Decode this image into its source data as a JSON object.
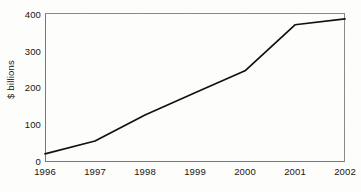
{
  "chart_data": {
    "type": "line",
    "title": "",
    "xlabel": "",
    "ylabel": "$ billions",
    "categories": [
      "1996",
      "1997",
      "1998",
      "1999",
      "2000",
      "2001",
      "2002"
    ],
    "x": [
      1996,
      1997,
      1998,
      1999,
      2000,
      2001,
      2002
    ],
    "values": [
      22,
      57,
      128,
      188,
      248,
      373,
      389
    ],
    "series": [
      {
        "name": "",
        "values": [
          22,
          57,
          128,
          188,
          248,
          373,
          389
        ]
      }
    ],
    "xlim": [
      1996,
      2002
    ],
    "ylim": [
      0,
      405
    ],
    "yticks": [
      0,
      100,
      200,
      300,
      400
    ],
    "ytick_labels": [
      "0",
      "100",
      "200",
      "300",
      "400"
    ],
    "xtick_labels": [
      "1996",
      "1997",
      "1998",
      "1999",
      "2000",
      "2001",
      "2002"
    ],
    "grid": false,
    "legend": false,
    "legend_position": "none",
    "markers": false,
    "line_color": "#111111",
    "axis_color": "#8a8a8a",
    "background_color": "#fdfdfb"
  },
  "axes": {
    "y_title": "$ billions",
    "y_ticks": [
      {
        "label": "400",
        "value": 400
      },
      {
        "label": "300",
        "value": 300
      },
      {
        "label": "200",
        "value": 200
      },
      {
        "label": "100",
        "value": 100
      },
      {
        "label": "0",
        "value": 0
      }
    ],
    "x_ticks": [
      {
        "label": "1996",
        "value": 1996
      },
      {
        "label": "1997",
        "value": 1997
      },
      {
        "label": "1998",
        "value": 1998
      },
      {
        "label": "1999",
        "value": 1999
      },
      {
        "label": "2000",
        "value": 2000
      },
      {
        "label": "2001",
        "value": 2001
      },
      {
        "label": "2002",
        "value": 2002
      }
    ]
  }
}
